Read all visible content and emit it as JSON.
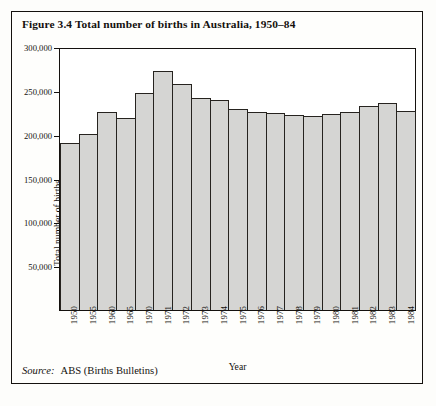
{
  "figure": {
    "title": "Figure 3.4  Total number of births in Australia, 1950–84",
    "source_label": "Source:",
    "source_text": "ABS (Births Bulletins)"
  },
  "chart_data": {
    "type": "bar",
    "title": "Figure 3.4  Total number of births in Australia, 1950–84",
    "xlabel": "Year",
    "ylabel": "Total number of births",
    "categories": [
      "1950",
      "1955",
      "1960",
      "1965",
      "1970",
      "1971",
      "1972",
      "1973",
      "1974",
      "1975",
      "1976",
      "1977",
      "1978",
      "1979",
      "1980",
      "1981",
      "1982",
      "1983",
      "1984"
    ],
    "values": [
      192500,
      202500,
      228000,
      221000,
      250000,
      274500,
      259500,
      243500,
      241500,
      231000,
      227500,
      226000,
      224500,
      223500,
      225500,
      227500,
      234500,
      238000,
      228500
    ],
    "ylim": [
      0,
      300000
    ],
    "yticks": [
      300000,
      250000,
      200000,
      150000,
      100000,
      50000
    ],
    "ytick_labels": [
      "300,000",
      "250,000",
      "200,000",
      "150,000",
      "100,000",
      "50,000"
    ],
    "grid": false,
    "legend": null,
    "bar_fill_color": "#d5d5d3",
    "bar_edge_color": "#26231f",
    "frame_color": "#14110e"
  }
}
